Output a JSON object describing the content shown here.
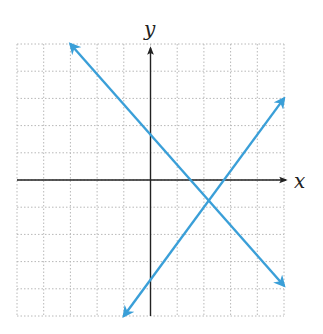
{
  "chart_data": {
    "type": "line",
    "title": "",
    "xlabel": "x",
    "ylabel": "y",
    "xlim": [
      -5,
      5
    ],
    "ylim": [
      -5,
      5
    ],
    "grid": true,
    "grid_step": 1,
    "tick_labels_shown": false,
    "legend": null,
    "series": [
      {
        "name": "line-decreasing",
        "equation": "y = -(10/9)x + 5/3",
        "slope": -1.111,
        "y_intercept": 1.667,
        "x_intercept": 1.5,
        "x": [
          -3,
          5
        ],
        "y": [
          5,
          -3.89
        ],
        "arrows": "both",
        "color": "#3a9fd8"
      },
      {
        "name": "line-increasing",
        "equation": "y = (4/3)x - 11/3",
        "slope": 1.333,
        "y_intercept": -3.667,
        "x_intercept": 2.75,
        "x": [
          -1,
          5
        ],
        "y": [
          -5,
          3
        ],
        "arrows": "both",
        "color": "#3a9fd8"
      }
    ],
    "intersection": {
      "x": 2.17,
      "y": -0.78
    }
  },
  "labels": {
    "x_axis": "x",
    "y_axis": "y"
  },
  "colors": {
    "line": "#3a9fd8",
    "axis": "#222222",
    "grid": "#b8b8b8"
  }
}
